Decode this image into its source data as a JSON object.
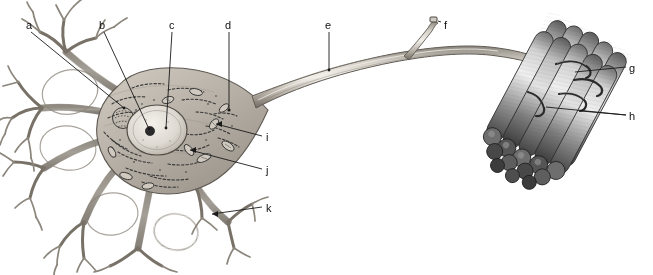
{
  "figure": {
    "background_color": "#ffffff",
    "width": 653,
    "height": 275,
    "line_color": "#1a1a1a",
    "label_color": "#111111",
    "cell_fill": "#b9b2a8",
    "cell_fill_light": "#d8d3cb",
    "muscle_dark": "#4a4a4a",
    "muscle_mid": "#8a8a8a",
    "muscle_light": "#cfcfcf",
    "nucleus_fill": "#e2ded6",
    "nucleolus_fill": "#2a2a2a"
  },
  "labels": [
    {
      "id": "a",
      "text": "a",
      "x": 26,
      "y": 20,
      "target_part": "dendrite-branch-upper-left"
    },
    {
      "id": "b",
      "text": "b",
      "x": 99,
      "y": 20,
      "target_part": "nucleolus"
    },
    {
      "id": "c",
      "text": "c",
      "x": 169,
      "y": 20,
      "target_part": "nucleus"
    },
    {
      "id": "d",
      "text": "d",
      "x": 225,
      "y": 20,
      "target_part": "axon-hillock"
    },
    {
      "id": "e",
      "text": "e",
      "x": 325,
      "y": 20,
      "target_part": "axon"
    },
    {
      "id": "f",
      "text": "f",
      "x": 444,
      "y": 20,
      "target_part": "axon-collateral-branch"
    },
    {
      "id": "g",
      "text": "g",
      "x": 629,
      "y": 63,
      "target_part": "muscle-fiber"
    },
    {
      "id": "h",
      "text": "h",
      "x": 629,
      "y": 111,
      "target_part": "motor-end-plates"
    },
    {
      "id": "i",
      "text": "i",
      "x": 266,
      "y": 132,
      "target_part": "mitochondrion"
    },
    {
      "id": "j",
      "text": "j",
      "x": 266,
      "y": 165,
      "target_part": "nissl-body"
    },
    {
      "id": "k",
      "text": "k",
      "x": 266,
      "y": 203,
      "target_part": "dendrite-lower-right"
    }
  ],
  "parts": {
    "soma": "cell body",
    "dendrites": "dendritic tree",
    "nucleus": "nucleus",
    "nucleolus": "nucleolus",
    "axon_hillock": "axon hillock",
    "axon": "axon",
    "collateral": "axon collateral",
    "terminal_branches": "terminal branches",
    "muscle_bundle": "skeletal muscle fiber bundle",
    "end_plates": "motor end plates"
  }
}
